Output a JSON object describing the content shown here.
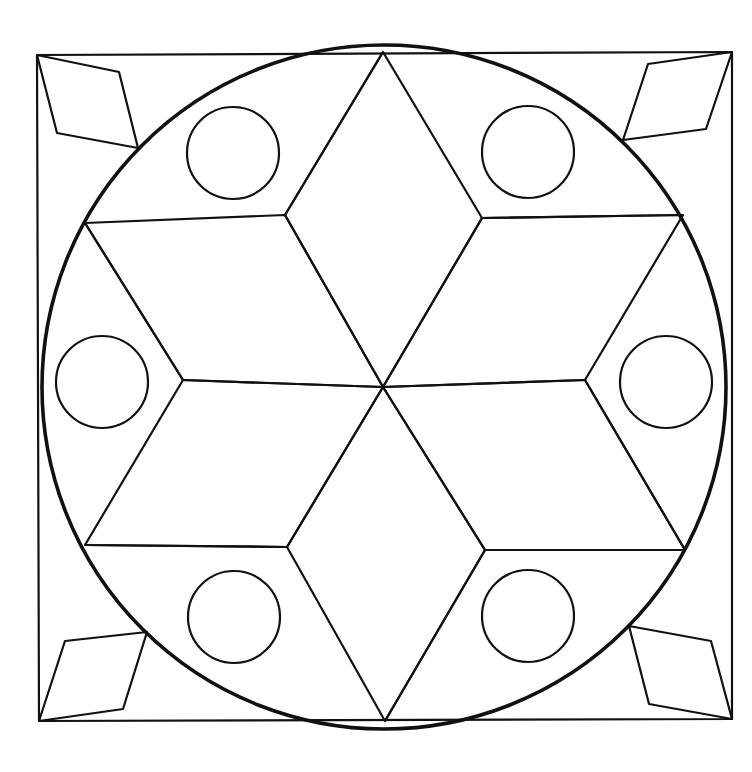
{
  "figure": {
    "stroke_color": "#111111",
    "background_color": "#ffffff",
    "frame": {
      "points": [
        [
          37,
          55
        ],
        [
          732,
          52
        ],
        [
          732,
          719
        ],
        [
          39,
          721
        ]
      ]
    },
    "main_circle": {
      "cx": 384,
      "cy": 387,
      "r": 342
    },
    "center": [
      383,
      387
    ],
    "star_outer_points": [
      [
        383,
        52
      ],
      [
        683,
        215
      ],
      [
        685,
        550
      ],
      [
        385,
        721
      ],
      [
        85,
        545
      ],
      [
        85,
        223
      ]
    ],
    "star_inner_points": [
      [
        482,
        218
      ],
      [
        585,
        380
      ],
      [
        485,
        550
      ],
      [
        287,
        547
      ],
      [
        183,
        380
      ],
      [
        285,
        215
      ]
    ],
    "small_circles": [
      {
        "cx": 233,
        "cy": 153,
        "r": 46
      },
      {
        "cx": 528,
        "cy": 152,
        "r": 46
      },
      {
        "cx": 102,
        "cy": 382,
        "r": 46
      },
      {
        "cx": 666,
        "cy": 382,
        "r": 46
      },
      {
        "cx": 234,
        "cy": 617,
        "r": 46
      },
      {
        "cx": 528,
        "cy": 616,
        "r": 46
      }
    ],
    "corner_rhombi": [
      {
        "name": "top-left",
        "points": [
          [
            37,
            55
          ],
          [
            119,
            72
          ],
          [
            138,
            148
          ],
          [
            57,
            133
          ]
        ]
      },
      {
        "name": "top-right",
        "points": [
          [
            732,
            52
          ],
          [
            648,
            64
          ],
          [
            623,
            140
          ],
          [
            706,
            129
          ]
        ]
      },
      {
        "name": "bottom-left",
        "points": [
          [
            39,
            721
          ],
          [
            123,
            709
          ],
          [
            147,
            632
          ],
          [
            65,
            641
          ]
        ]
      },
      {
        "name": "bottom-right",
        "points": [
          [
            732,
            719
          ],
          [
            649,
            704
          ],
          [
            629,
            626
          ],
          [
            711,
            641
          ]
        ]
      }
    ]
  }
}
